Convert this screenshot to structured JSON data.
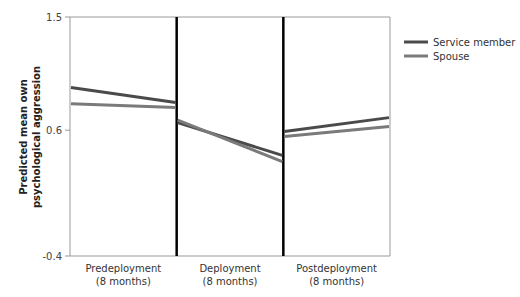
{
  "chart_data": {
    "type": "line",
    "title": "",
    "xlabel": "",
    "ylabel": "Predicted mean own psychological aggression",
    "ylabel_lines": [
      "Predicted mean own",
      "psychological aggression"
    ],
    "ylim": [
      -0.4,
      1.5
    ],
    "yticks": [
      "1.5",
      "0.6",
      "-0.4"
    ],
    "ytick_values": [
      1.5,
      0.6,
      -0.4
    ],
    "periods": [
      {
        "label": "Predeployment",
        "sublabel": "(8 months)"
      },
      {
        "label": "Deployment",
        "sublabel": "(8 months)"
      },
      {
        "label": "Postdeployment",
        "sublabel": "(8 months)"
      }
    ],
    "series": [
      {
        "name": "Service member",
        "color": "#4a4a4a",
        "segments": [
          [
            0.94,
            0.82
          ],
          [
            0.66,
            0.4
          ],
          [
            0.59,
            0.7
          ]
        ]
      },
      {
        "name": "Spouse",
        "color": "#7a7a7a",
        "segments": [
          [
            0.81,
            0.78
          ],
          [
            0.68,
            0.35
          ],
          [
            0.55,
            0.63
          ]
        ]
      }
    ],
    "legend_position": "top-right",
    "grid": false
  }
}
